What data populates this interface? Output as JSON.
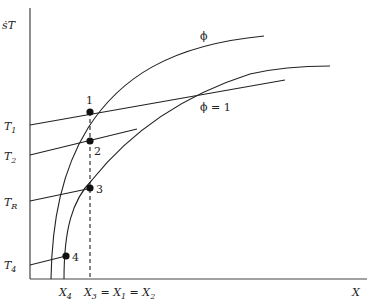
{
  "diagram": {
    "y_axis_label": "ṡT",
    "x_axis_label": "X",
    "curves": [
      {
        "id": "phi",
        "label": "ϕ"
      },
      {
        "id": "phi1",
        "label": "ϕ = 1"
      }
    ],
    "operating_lines": [
      {
        "id": "T1",
        "label": "T",
        "sub": "1"
      },
      {
        "id": "T2",
        "label": "T",
        "sub": "2"
      },
      {
        "id": "TR",
        "label": "T",
        "sub": "R"
      },
      {
        "id": "T4",
        "label": "T",
        "sub": "4"
      }
    ],
    "points": [
      {
        "id": "1",
        "label": "1"
      },
      {
        "id": "2",
        "label": "2"
      },
      {
        "id": "3",
        "label": "3"
      },
      {
        "id": "4",
        "label": "4"
      }
    ],
    "x_ticks": {
      "x4": {
        "label": "X",
        "sub": "4"
      },
      "x3": {
        "parts": [
          {
            "label": "X",
            "sub": "3"
          },
          {
            "label": " = X",
            "sub": "1"
          },
          {
            "label": " = X",
            "sub": "2"
          }
        ]
      }
    }
  }
}
